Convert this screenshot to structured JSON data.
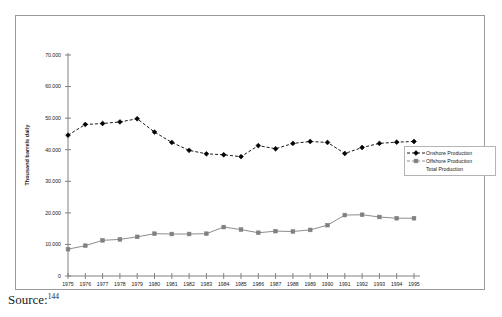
{
  "caption": {
    "source_label": "Source:",
    "footnote_marker": "144"
  },
  "legend": {
    "position": "right",
    "entries": [
      {
        "label": "Onshore Production",
        "marker": "diamond",
        "color": "#000000",
        "has_key": true
      },
      {
        "label": "Offshore Production",
        "marker": "square",
        "color": "#808080",
        "has_key": true
      },
      {
        "label": "Total Production",
        "marker": "none",
        "color": "#808080",
        "has_key": false
      }
    ]
  },
  "chart_data": {
    "type": "line",
    "title": "",
    "subtitle": "",
    "xlabel": "",
    "ylabel": "Thousand barrels daily",
    "xlim": [
      1975,
      1995
    ],
    "ylim": [
      0,
      70000
    ],
    "ytick_step": 10000,
    "grid": false,
    "legend_position": "right",
    "x": [
      1975,
      1976,
      1977,
      1978,
      1979,
      1980,
      1981,
      1982,
      1983,
      1984,
      1985,
      1986,
      1987,
      1988,
      1989,
      1990,
      1991,
      1992,
      1993,
      1994,
      1995
    ],
    "categories": [
      "1975",
      "1976",
      "1977",
      "1978",
      "1979",
      "1980",
      "1981",
      "1982",
      "1983",
      "1984",
      "1985",
      "1986",
      "1987",
      "1988",
      "1989",
      "1990",
      "1991",
      "1992",
      "1993",
      "1994",
      "1995"
    ],
    "ytick_labels": [
      "0",
      "10.000",
      "20.000",
      "30.000",
      "40.000",
      "50.000",
      "60.000",
      "70.000"
    ],
    "ytick_values": [
      0,
      10000,
      20000,
      30000,
      40000,
      50000,
      60000,
      70000
    ],
    "series": [
      {
        "name": "Onshore Production",
        "marker": "diamond",
        "color": "#000000",
        "linestyle": "dashed",
        "values": [
          44600,
          48000,
          48300,
          48800,
          49800,
          45600,
          42300,
          39800,
          38700,
          38400,
          37800,
          41300,
          40300,
          42000,
          42600,
          42300,
          38800,
          40700,
          42000,
          42400,
          42600
        ]
      },
      {
        "name": "Offshore Production",
        "marker": "square",
        "color": "#808080",
        "linestyle": "solid",
        "values": [
          8500,
          9600,
          11300,
          11600,
          12400,
          13400,
          13300,
          13300,
          13400,
          15500,
          14700,
          13700,
          14200,
          14100,
          14600,
          16100,
          19300,
          19400,
          18700,
          18300,
          18300
        ]
      }
    ]
  }
}
